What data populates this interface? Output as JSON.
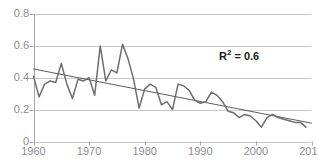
{
  "chart_data": {
    "type": "line",
    "title": "",
    "xlabel": "",
    "ylabel": "",
    "xlim": [
      1960,
      2010
    ],
    "ylim": [
      0,
      0.8
    ],
    "grid": true,
    "legend": false,
    "x_ticks": [
      "1960",
      "1970",
      "1980",
      "1990",
      "2000",
      "2010"
    ],
    "x_tick_values": [
      1960,
      1970,
      1980,
      1990,
      2000,
      2010
    ],
    "y_ticks": [
      "0",
      "0.2",
      "0.4",
      "0.6",
      "0.8"
    ],
    "y_tick_values": [
      0,
      0.2,
      0.4,
      0.6,
      0.8
    ],
    "annotations": [
      {
        "name": "r-squared",
        "text_prefix": "R",
        "text_sup": "2",
        "text_suffix": " = 0.6",
        "value": 0.6
      }
    ],
    "series": [
      {
        "name": "data",
        "color": "#6e6e6e",
        "x": [
          1960,
          1961,
          1962,
          1963,
          1964,
          1965,
          1966,
          1967,
          1968,
          1969,
          1970,
          1971,
          1972,
          1973,
          1974,
          1975,
          1976,
          1977,
          1978,
          1979,
          1980,
          1981,
          1982,
          1983,
          1984,
          1985,
          1986,
          1987,
          1988,
          1989,
          1990,
          1991,
          1992,
          1993,
          1994,
          1995,
          1996,
          1997,
          1998,
          1999,
          2000,
          2001,
          2002,
          2003,
          2004,
          2005,
          2006,
          2007,
          2008,
          2009
        ],
        "values": [
          0.41,
          0.28,
          0.36,
          0.38,
          0.37,
          0.49,
          0.36,
          0.27,
          0.39,
          0.38,
          0.4,
          0.29,
          0.6,
          0.38,
          0.45,
          0.43,
          0.61,
          0.52,
          0.39,
          0.21,
          0.33,
          0.36,
          0.34,
          0.23,
          0.25,
          0.2,
          0.36,
          0.35,
          0.32,
          0.26,
          0.24,
          0.25,
          0.31,
          0.29,
          0.25,
          0.19,
          0.18,
          0.15,
          0.17,
          0.16,
          0.13,
          0.09,
          0.15,
          0.17,
          0.15,
          0.14,
          0.13,
          0.12,
          0.12,
          0.09
        ]
      },
      {
        "name": "linear-trendline",
        "color": "#4a4a4a",
        "x": [
          1960,
          2010
        ],
        "values": [
          0.455,
          0.115
        ]
      }
    ],
    "colors": {
      "data_line": "#6e6e6e",
      "trendline": "#4a4a4a",
      "gridline": "#c8c8c8",
      "axis": "#a6a6a6",
      "tick_label": "#8c8c8c",
      "annotation_text": "#1a1a1a",
      "background": "#ffffff"
    }
  }
}
